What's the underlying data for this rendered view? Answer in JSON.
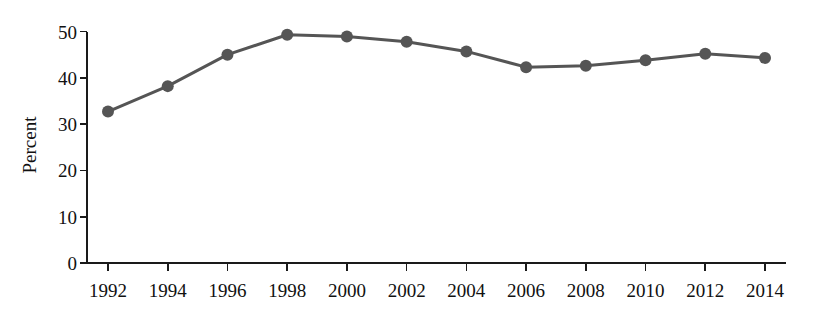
{
  "chart_data": {
    "type": "line",
    "title": "",
    "subtitle": "",
    "xlabel": "",
    "ylabel": "Percent",
    "categories": [
      "1992",
      "1994",
      "1996",
      "1998",
      "2000",
      "2002",
      "2004",
      "2006",
      "2008",
      "2010",
      "2012",
      "2014"
    ],
    "x": [
      1992,
      1994,
      1996,
      1998,
      2000,
      2002,
      2004,
      2006,
      2008,
      2010,
      2012,
      2014
    ],
    "values": [
      32.7,
      38.2,
      45.0,
      49.3,
      48.9,
      47.8,
      45.7,
      42.3,
      42.6,
      43.8,
      45.2,
      44.3
    ],
    "series": [
      {
        "name": "Percent",
        "values": [
          32.7,
          38.2,
          45.0,
          49.3,
          48.9,
          47.8,
          45.7,
          42.3,
          42.6,
          43.8,
          45.2,
          44.3
        ]
      }
    ],
    "xlim": [
      1991,
      2015
    ],
    "ylim": [
      0,
      50
    ],
    "y_ticks": [
      0,
      10,
      20,
      30,
      40,
      50
    ],
    "y_tick_labels": [
      "0",
      "10",
      "20",
      "30",
      "40",
      "50"
    ],
    "x_ticks": [
      1992,
      1994,
      1996,
      1998,
      2000,
      2002,
      2004,
      2006,
      2008,
      2010,
      2012,
      2014
    ],
    "grid": false,
    "legend": false,
    "legend_position": "none",
    "marker": "circle",
    "line_color": "#555555",
    "marker_color": "#555555",
    "background_color": "#ffffff",
    "axis_color": "#1a1a1a",
    "annotations": []
  },
  "axes": {
    "y_axis_title": "Percent"
  }
}
